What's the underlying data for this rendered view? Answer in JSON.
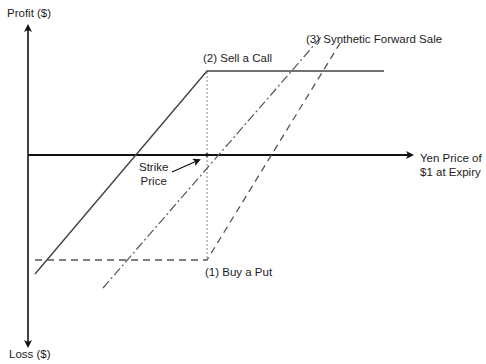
{
  "axes": {
    "y_top_label": "Profit ($)",
    "y_bottom_label": "Loss ($)",
    "x_label_line1": "Yen Price of",
    "x_label_line2": "$1 at Expiry"
  },
  "annotations": {
    "strike_line1": "Strike",
    "strike_line2": "Price",
    "sell_call": "(2) Sell a Call",
    "buy_put": "(1) Buy a Put",
    "synthetic": "(3) Synthetic Forward Sale"
  },
  "colors": {
    "axis": "#111111",
    "sell_call": "#444444",
    "buy_put": "#555555",
    "synthetic": "#555555",
    "strike_guide": "#888888"
  },
  "series": [
    {
      "name": "(1) Buy a Put",
      "style": "dashed",
      "points": [
        [
          35,
          260
        ],
        [
          207,
          260
        ],
        [
          342,
          40
        ]
      ]
    },
    {
      "name": "(2) Sell a Call",
      "style": "solid",
      "points": [
        [
          35,
          274
        ],
        [
          207,
          71
        ],
        [
          384,
          71
        ]
      ]
    },
    {
      "name": "(3) Synthetic Forward Sale",
      "style": "dash-dot",
      "points": [
        [
          103,
          288
        ],
        [
          322,
          36
        ]
      ]
    }
  ]
}
